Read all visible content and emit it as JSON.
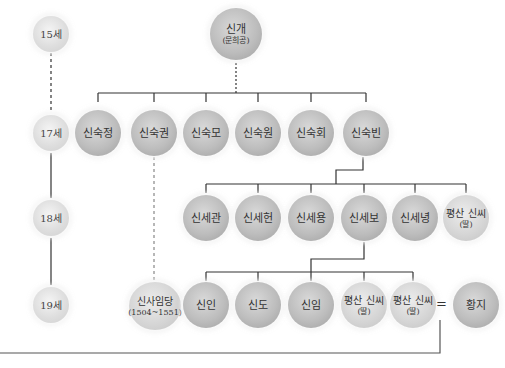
{
  "title_cutoff": "",
  "generations": [
    {
      "label": "15세"
    },
    {
      "label": "17세"
    },
    {
      "label": "18세"
    },
    {
      "label": "19세"
    }
  ],
  "root": {
    "name": "신개",
    "sub": "(문희공)"
  },
  "gen17": [
    {
      "name": "신숙정"
    },
    {
      "name": "신숙권"
    },
    {
      "name": "신숙모"
    },
    {
      "name": "신숙원"
    },
    {
      "name": "신숙회"
    },
    {
      "name": "신숙빈"
    }
  ],
  "gen18": [
    {
      "name": "신세관"
    },
    {
      "name": "신세헌"
    },
    {
      "name": "신세용"
    },
    {
      "name": "신세보"
    },
    {
      "name": "신세녕"
    },
    {
      "name": "평산 신씨",
      "sub": "(딸)"
    }
  ],
  "gen19": [
    {
      "name": "신사임당",
      "sub": "(1504~1551)"
    },
    {
      "name": "신인"
    },
    {
      "name": "신도"
    },
    {
      "name": "신임"
    },
    {
      "name": "평산 신씨",
      "sub": "(딸)"
    },
    {
      "name": "평산 신씨",
      "sub": "(딸)"
    }
  ],
  "spouse": {
    "symbol": "=",
    "name": "황지"
  },
  "colors": {
    "line": "#333333",
    "node": "#bdbdbd",
    "gen_node": "#dedede",
    "text": "#333333"
  }
}
